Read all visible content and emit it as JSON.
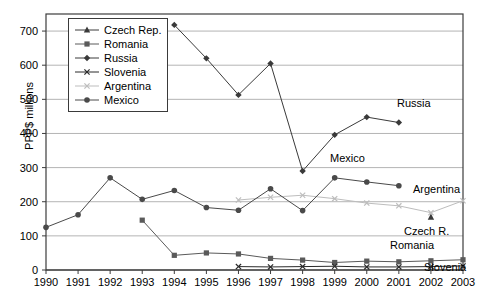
{
  "chart_data": {
    "type": "line",
    "title": "",
    "xlabel": "",
    "ylabel": "PPP$ millions",
    "x": [
      1990,
      1991,
      1992,
      1993,
      1994,
      1995,
      1996,
      1997,
      1998,
      1999,
      2000,
      2001,
      2002,
      2003
    ],
    "xtick_labels": [
      "1990",
      "1991",
      "1992",
      "1993",
      "1994",
      "1995",
      "1996",
      "1997",
      "1998",
      "1999",
      "2000",
      "2001",
      "2002",
      "2003"
    ],
    "ytick_labels": [
      "0",
      "100",
      "200",
      "300",
      "400",
      "500",
      "600",
      "700"
    ],
    "yticks": [
      0,
      100,
      200,
      300,
      400,
      500,
      600,
      700
    ],
    "ylim": [
      0,
      750
    ],
    "xlim": [
      1990,
      2003
    ],
    "grid": true,
    "legend_position": "upper-left-inside",
    "series": [
      {
        "name": "Czech Rep.",
        "marker": "triangle",
        "color": "#3a3a3a",
        "x": [
          2002
        ],
        "values": [
          155
        ]
      },
      {
        "name": "Romania",
        "marker": "square",
        "color": "#5a5a5a",
        "x": [
          1993,
          1994,
          1995,
          1996,
          1997,
          1998,
          1999,
          2000,
          2001,
          2002,
          2003
        ],
        "values": [
          146,
          43,
          50,
          47,
          34,
          29,
          22,
          26,
          24,
          27,
          30
        ]
      },
      {
        "name": "Russia",
        "marker": "diamond",
        "color": "#3a3a3a",
        "x": [
          1994,
          1995,
          1996,
          1997,
          1998,
          1999,
          2000,
          2001
        ],
        "values": [
          718,
          620,
          513,
          605,
          290,
          396,
          448,
          432
        ]
      },
      {
        "name": "Slovenia",
        "marker": "x",
        "color": "#2a2a2a",
        "x": [
          1996,
          1997,
          1998,
          1999,
          2000,
          2001,
          2002,
          2003
        ],
        "values": [
          10,
          9,
          10,
          11,
          9,
          9,
          10,
          12
        ]
      },
      {
        "name": "Argentina",
        "marker": "x-light",
        "color": "#bdbdbd",
        "x": [
          1996,
          1997,
          1998,
          1999,
          2000,
          2001,
          2002,
          2003
        ],
        "values": [
          205,
          213,
          219,
          209,
          196,
          188,
          168,
          203
        ]
      },
      {
        "name": "Mexico",
        "marker": "circle",
        "color": "#4a4a4a",
        "x": [
          1990,
          1991,
          1992,
          1993,
          1994,
          1995,
          1996,
          1997,
          1998,
          1999,
          2000,
          2001
        ],
        "values": [
          125,
          162,
          270,
          207,
          233,
          183,
          175,
          238,
          174,
          270,
          258,
          247
        ]
      }
    ],
    "annotations": [
      {
        "text": "Russia",
        "x": 397,
        "y": 98
      },
      {
        "text": "Mexico",
        "x": 330,
        "y": 153
      },
      {
        "text": "Argentina",
        "x": 413,
        "y": 184
      },
      {
        "text": "Czech R.",
        "x": 404,
        "y": 226
      },
      {
        "text": "Romania",
        "x": 390,
        "y": 240
      },
      {
        "text": "Slovenia",
        "x": 424,
        "y": 262
      }
    ]
  },
  "legend": {
    "items": [
      {
        "label": "Czech Rep."
      },
      {
        "label": "Romania"
      },
      {
        "label": "Russia"
      },
      {
        "label": "Slovenia"
      },
      {
        "label": "Argentina"
      },
      {
        "label": "Mexico"
      }
    ]
  },
  "colors": {
    "grid": "#b4b4b4",
    "axis": "#3c3c3c",
    "background": "#ffffff",
    "argentina": "#bdbdbd",
    "series_dark": "#3a3a3a"
  }
}
